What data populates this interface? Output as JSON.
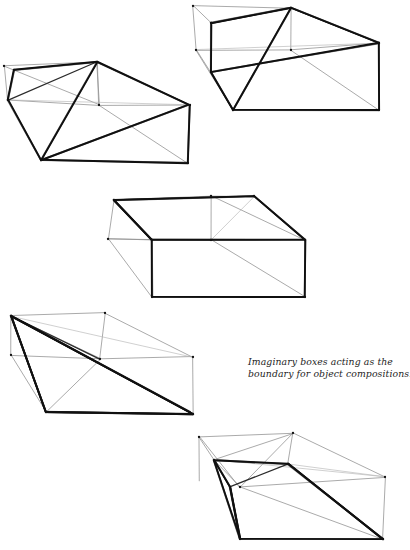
{
  "page": {
    "background_color": "#ffffff",
    "width": 410,
    "height": 550,
    "medium": "hand-drawn pencil sketch"
  },
  "caption": {
    "line1": "Imaginary boxes acting as the",
    "line2": "boundary for object compositions.",
    "full_text": "Imaginary boxes acting as the boundary for object compositions.",
    "style": "italic",
    "color": "#1d1d1d"
  },
  "ink": {
    "heavy_color": "#111111",
    "medium_color": "#2b2b2b",
    "light_color": "#8e8e8e",
    "faint_color": "#b6b6b6"
  },
  "figures": [
    {
      "id": "box-upper-left",
      "label": "Imaginary box 1 (upper left)",
      "heavy_paths": [
        "M 8 100 L 14 70 L 97 62 L 190 105 L 188 163 L 41 160 L 8 100 Z",
        "M 97 62 L 41 160",
        "M 41 160 L 188 105"
      ],
      "medium_paths": [
        "M 8 100 L 97 62",
        "M 97 62 L 190 105"
      ],
      "light_paths": [
        "M 4 66 L 97 62",
        "M 4 66 L 8 100",
        "M 4 66 L 99 105",
        "M 99 105 L 8 100",
        "M 99 105 L 190 105",
        "M 99 105 L 97 62",
        "M 99 105 L 188 163",
        "M 97 62 L 99 105"
      ],
      "faint_paths": [
        "M 8 100 L 190 105"
      ],
      "vertices": [
        [
          8,
          100
        ],
        [
          14,
          70
        ],
        [
          97,
          62
        ],
        [
          190,
          105
        ],
        [
          188,
          163
        ],
        [
          41,
          160
        ],
        [
          99,
          105
        ],
        [
          4,
          66
        ]
      ]
    },
    {
      "id": "box-upper-right",
      "label": "Imaginary box 2 (upper right)",
      "heavy_paths": [
        "M 211 23 L 291 8 L 379 43 L 379 110 L 233 110 L 211 72 L 211 23 Z",
        "M 291 8 L 233 110",
        "M 211 72 L 379 43"
      ],
      "medium_paths": [
        "M 211 23 L 291 8",
        "M 291 8 L 379 43",
        "M 211 72 L 233 110"
      ],
      "light_paths": [
        "M 193 6 L 291 8",
        "M 193 6 L 196 50",
        "M 196 50 L 211 72",
        "M 196 50 L 291 50",
        "M 291 50 L 379 43",
        "M 291 50 L 291 8",
        "M 196 50 L 233 110",
        "M 193 6 L 211 23",
        "M 291 50 L 379 110"
      ],
      "faint_paths": [
        "M 196 50 L 379 43",
        "M 211 23 L 211 72"
      ],
      "vertices": [
        [
          211,
          23
        ],
        [
          291,
          8
        ],
        [
          379,
          43
        ],
        [
          379,
          110
        ],
        [
          233,
          110
        ],
        [
          211,
          72
        ],
        [
          291,
          50
        ],
        [
          196,
          50
        ],
        [
          193,
          6
        ]
      ]
    },
    {
      "id": "box-middle",
      "label": "Imaginary box 3 (middle)",
      "heavy_paths": [
        "M 114 200 L 254 196 L 305 240 L 305 297 L 152 297 L 152 240 L 114 200 Z",
        "M 114 200 L 152 240",
        "M 152 240 L 305 240"
      ],
      "medium_paths": [
        "M 114 200 L 254 196",
        "M 254 196 L 305 240"
      ],
      "light_paths": [
        "M 108 239 L 152 240",
        "M 108 239 L 114 200",
        "M 108 239 L 152 297",
        "M 211 196 L 211 240",
        "M 211 196 L 305 240",
        "M 211 240 L 305 297",
        "M 114 200 L 211 196",
        "M 108 239 L 211 240"
      ],
      "faint_paths": [
        "M 254 196 L 211 240",
        "M 211 196 L 254 196"
      ],
      "vertices": [
        [
          114,
          200
        ],
        [
          254,
          196
        ],
        [
          305,
          240
        ],
        [
          305,
          297
        ],
        [
          152,
          297
        ],
        [
          152,
          240
        ],
        [
          108,
          239
        ],
        [
          211,
          196
        ],
        [
          211,
          240
        ]
      ]
    },
    {
      "id": "box-lower-left",
      "label": "Imaginary box 4 (lower left)",
      "heavy_paths": [
        "M 11 316 L 46 412 L 193 414 L 11 316 Z",
        "M 11 316 L 190 412",
        "M 11 316 L 46 412",
        "M 46 412 L 193 414"
      ],
      "medium_paths": [
        "M 11 316 L 193 414",
        "M 11 316 L 100 359"
      ],
      "light_paths": [
        "M 11 316 L 105 313",
        "M 105 313 L 193 357",
        "M 105 313 L 100 359",
        "M 100 359 L 193 357",
        "M 100 359 L 11 316",
        "M 193 357 L 193 414",
        "M 100 359 L 46 412",
        "M 11 316 L 11 355",
        "M 11 355 L 100 359",
        "M 11 355 L 46 412"
      ],
      "faint_paths": [
        "M 11 316 L 193 357"
      ],
      "vertices": [
        [
          11,
          316
        ],
        [
          105,
          313
        ],
        [
          193,
          357
        ],
        [
          193,
          414
        ],
        [
          46,
          412
        ],
        [
          100,
          359
        ],
        [
          11,
          355
        ]
      ]
    },
    {
      "id": "box-lower-right",
      "label": "Imaginary box 5 (lower right)",
      "heavy_paths": [
        "M 214 460 L 230 487 L 240 539 L 383 539 L 288 464 L 214 460 Z",
        "M 230 487 L 240 539",
        "M 214 460 L 240 539",
        "M 288 464 L 383 539"
      ],
      "medium_paths": [
        "M 214 460 L 230 487",
        "M 230 487 L 288 464"
      ],
      "light_paths": [
        "M 199 437 L 293 433",
        "M 199 437 L 214 460",
        "M 293 433 L 385 477",
        "M 293 433 L 288 464",
        "M 214 460 L 293 433",
        "M 199 437 L 240 487",
        "M 240 487 L 293 433",
        "M 240 487 L 385 477",
        "M 240 487 L 214 460",
        "M 385 477 L 383 539",
        "M 240 487 L 383 539",
        "M 199 437 L 199 481"
      ],
      "faint_paths": [
        "M 214 460 L 385 477",
        "M 288 464 L 385 477"
      ],
      "vertices": [
        [
          214,
          460
        ],
        [
          230,
          487
        ],
        [
          240,
          539
        ],
        [
          383,
          539
        ],
        [
          288,
          464
        ],
        [
          293,
          433
        ],
        [
          199,
          437
        ],
        [
          240,
          487
        ],
        [
          385,
          477
        ]
      ]
    }
  ]
}
